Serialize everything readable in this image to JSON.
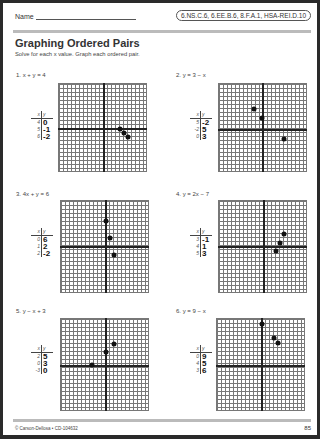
{
  "header": {
    "name_label": "Name",
    "standards": "6.NS.C.6, 6.EE.B.6, 8.F.A.1, HSA-REI.D.10",
    "title": "Graphing Ordered Pairs",
    "instructions": "Solve for each x value. Graph each ordered pair."
  },
  "problems": [
    {
      "label": "1.  x + y = 4",
      "x_header": "x",
      "y_header": "y",
      "rows": [
        {
          "x": "4",
          "y": "0"
        },
        {
          "x": "5",
          "y": "-1"
        },
        {
          "x": "6",
          "y": "-2"
        }
      ]
    },
    {
      "label": "2.  y = 3 − x",
      "x_header": "x",
      "y_header": "y",
      "rows": [
        {
          "x": "5",
          "y": "-2"
        },
        {
          "x": "-2",
          "y": "5"
        },
        {
          "x": "0",
          "y": "3"
        }
      ]
    },
    {
      "label": "3.  4x + y = 6",
      "x_header": "x",
      "y_header": "y",
      "rows": [
        {
          "x": "0",
          "y": "6"
        },
        {
          "x": "1",
          "y": "2"
        },
        {
          "x": "2",
          "y": "-2"
        }
      ]
    },
    {
      "label": "4.  y = 2x − 7",
      "x_header": "x",
      "y_header": "y",
      "rows": [
        {
          "x": "3",
          "y": "-1"
        },
        {
          "x": "4",
          "y": "1"
        },
        {
          "x": "5",
          "y": "3"
        }
      ]
    },
    {
      "label": "5.  y − x + 3",
      "x_header": "x",
      "y_header": "y",
      "rows": [
        {
          "x": "2",
          "y": "5"
        },
        {
          "x": "0",
          "y": "3"
        },
        {
          "x": "-3",
          "y": "0"
        }
      ]
    },
    {
      "label": "6.  y = 9 − x",
      "x_header": "x",
      "y_header": "y",
      "rows": [
        {
          "x": "0",
          "y": "9"
        },
        {
          "x": "4",
          "y": "5"
        },
        {
          "x": "3",
          "y": "6"
        }
      ]
    }
  ],
  "footer": {
    "copyright": "© Carson-Dellosa • CD-104632",
    "page_number": "85"
  }
}
